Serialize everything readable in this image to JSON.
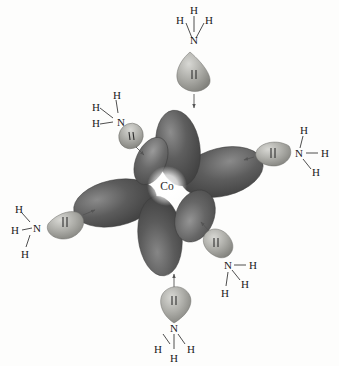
{
  "figure": {
    "metal": {
      "symbol": "Co",
      "name": "cobalt-center",
      "cx": 167,
      "cy": 186
    },
    "colors": {
      "orbital_dark": "#4a4a4a",
      "orbital_mid": "#6d6d6d",
      "orbital_light": "#a9a9a9",
      "orbital_edge": "#3a3a3a",
      "lone_pair_light": "#c9c9c4",
      "lone_pair_mid": "#9a9a95",
      "lone_pair_dark": "#7d7d78",
      "bond_stroke": "#3a3a3a",
      "text": "#1a1a1a",
      "background": "#fdfdfc"
    },
    "orbital_lobes": [
      {
        "name": "lobe-up",
        "cx": 178,
        "cy": 148,
        "rx": 22,
        "ry": 38,
        "rotate": -8
      },
      {
        "name": "lobe-down",
        "cx": 160,
        "cy": 235,
        "rx": 22,
        "ry": 40,
        "rotate": -6
      },
      {
        "name": "lobe-left",
        "cx": 115,
        "cy": 203,
        "rx": 42,
        "ry": 23,
        "rotate": -12
      },
      {
        "name": "lobe-right",
        "cx": 222,
        "cy": 172,
        "rx": 42,
        "ry": 24,
        "rotate": -14
      },
      {
        "name": "lobe-upper-left",
        "cx": 152,
        "cy": 160,
        "rx": 15,
        "ry": 25,
        "rotate": 22
      },
      {
        "name": "lobe-lower-right",
        "cx": 196,
        "cy": 216,
        "rx": 19,
        "ry": 27,
        "rotate": 20
      }
    ],
    "ligands": [
      {
        "name": "ammonia-top",
        "position": "top",
        "nitrogen": "N",
        "hydrogens": [
          "H",
          "H",
          "H"
        ],
        "lone_pair_symbol": "‖",
        "donates_to": "lobe-up"
      },
      {
        "name": "ammonia-upper-left",
        "position": "upper-left",
        "nitrogen": "N",
        "hydrogens": [
          "H",
          "H",
          "H"
        ],
        "lone_pair_symbol": "‖",
        "donates_to": "lobe-upper-left"
      },
      {
        "name": "ammonia-right",
        "position": "right",
        "nitrogen": "N",
        "hydrogens": [
          "H",
          "H",
          "H"
        ],
        "lone_pair_symbol": "‖",
        "donates_to": "lobe-right"
      },
      {
        "name": "ammonia-left",
        "position": "left",
        "nitrogen": "N",
        "hydrogens": [
          "H",
          "H",
          "H"
        ],
        "lone_pair_symbol": "‖",
        "donates_to": "lobe-left"
      },
      {
        "name": "ammonia-lower-right",
        "position": "lower-right",
        "nitrogen": "N",
        "hydrogens": [
          "H",
          "H",
          "H"
        ],
        "lone_pair_symbol": "‖",
        "donates_to": "lobe-lower-right"
      },
      {
        "name": "ammonia-bottom",
        "position": "bottom",
        "nitrogen": "N",
        "hydrogens": [
          "H",
          "H",
          "H"
        ],
        "lone_pair_symbol": "‖",
        "donates_to": "lobe-down"
      }
    ],
    "labels": {
      "metal_symbol": "Co",
      "n_top": "N",
      "n_top_h1": "H",
      "n_top_h2": "H",
      "n_top_h3": "H",
      "n_ul": "N",
      "n_ul_h1": "H",
      "n_ul_h2": "H",
      "n_ul_h3": "H",
      "n_right": "N",
      "n_right_h1": "H",
      "n_right_h2": "H",
      "n_right_h3": "H",
      "n_left": "N",
      "n_left_h1": "H",
      "n_left_h2": "H",
      "n_left_h3": "H",
      "n_lr": "N",
      "n_lr_h1": "H",
      "n_lr_h2": "H",
      "n_lr_h3": "H",
      "n_bottom": "N",
      "n_bottom_h1": "H",
      "n_bottom_h2": "H",
      "n_bottom_h3": "H"
    }
  }
}
